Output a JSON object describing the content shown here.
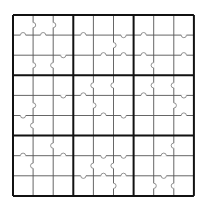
{
  "puzzle": {
    "type": "sudoku-with-border-marks",
    "size": 9,
    "box_size": 3,
    "origin": {
      "x": 13,
      "y": 15
    },
    "cell_size": 20.1,
    "values": [
      [
        "",
        "",
        "",
        "",
        "",
        "",
        "",
        "",
        ""
      ],
      [
        "",
        "",
        "",
        "",
        "",
        "",
        "",
        "",
        ""
      ],
      [
        "",
        "",
        "",
        "",
        "",
        "",
        "",
        "",
        ""
      ],
      [
        "",
        "",
        "",
        "",
        "",
        "",
        "",
        "",
        ""
      ],
      [
        "",
        "",
        "",
        "",
        "",
        "",
        "",
        "",
        ""
      ],
      [
        "",
        "",
        "",
        "",
        "",
        "",
        "",
        "",
        ""
      ],
      [
        "",
        "",
        "",
        "",
        "",
        "",
        "",
        "",
        ""
      ],
      [
        "",
        "",
        "",
        "",
        "",
        "",
        "",
        "",
        ""
      ],
      [
        "",
        "",
        "",
        "",
        "",
        "",
        "",
        "",
        ""
      ]
    ],
    "vertical_marks": [
      {
        "row": 0,
        "after_col": 0,
        "dir": "right"
      },
      {
        "row": 0,
        "after_col": 1,
        "dir": "right"
      },
      {
        "row": 1,
        "after_col": 4,
        "dir": "right"
      },
      {
        "row": 2,
        "after_col": 0,
        "dir": "right"
      },
      {
        "row": 2,
        "after_col": 1,
        "dir": "left"
      },
      {
        "row": 2,
        "after_col": 6,
        "dir": "left"
      },
      {
        "row": 3,
        "after_col": 3,
        "dir": "left"
      },
      {
        "row": 3,
        "after_col": 4,
        "dir": "left"
      },
      {
        "row": 3,
        "after_col": 6,
        "dir": "left"
      },
      {
        "row": 3,
        "after_col": 7,
        "dir": "left"
      },
      {
        "row": 4,
        "after_col": 0,
        "dir": "right"
      },
      {
        "row": 4,
        "after_col": 3,
        "dir": "right"
      },
      {
        "row": 4,
        "after_col": 7,
        "dir": "right"
      },
      {
        "row": 5,
        "after_col": 0,
        "dir": "left"
      },
      {
        "row": 6,
        "after_col": 1,
        "dir": "left"
      },
      {
        "row": 6,
        "after_col": 7,
        "dir": "left"
      },
      {
        "row": 7,
        "after_col": 0,
        "dir": "left"
      },
      {
        "row": 7,
        "after_col": 3,
        "dir": "left"
      },
      {
        "row": 7,
        "after_col": 4,
        "dir": "left"
      },
      {
        "row": 8,
        "after_col": 4,
        "dir": "right"
      },
      {
        "row": 8,
        "after_col": 6,
        "dir": "right"
      },
      {
        "row": 8,
        "after_col": 7,
        "dir": "left"
      }
    ],
    "horizontal_marks": [
      {
        "col": 0,
        "after_row": 0,
        "dir": "up"
      },
      {
        "col": 1,
        "after_row": 0,
        "dir": "up"
      },
      {
        "col": 3,
        "after_row": 0,
        "dir": "up"
      },
      {
        "col": 5,
        "after_row": 0,
        "dir": "down"
      },
      {
        "col": 6,
        "after_row": 0,
        "dir": "up"
      },
      {
        "col": 8,
        "after_row": 0,
        "dir": "down"
      },
      {
        "col": 2,
        "after_row": 1,
        "dir": "down"
      },
      {
        "col": 4,
        "after_row": 1,
        "dir": "up"
      },
      {
        "col": 5,
        "after_row": 1,
        "dir": "up"
      },
      {
        "col": 6,
        "after_row": 1,
        "dir": "up"
      },
      {
        "col": 8,
        "after_row": 1,
        "dir": "up"
      },
      {
        "col": 2,
        "after_row": 3,
        "dir": "down"
      },
      {
        "col": 3,
        "after_row": 3,
        "dir": "up"
      },
      {
        "col": 6,
        "after_row": 3,
        "dir": "up"
      },
      {
        "col": 8,
        "after_row": 3,
        "dir": "down"
      },
      {
        "col": 0,
        "after_row": 4,
        "dir": "down"
      },
      {
        "col": 4,
        "after_row": 4,
        "dir": "up"
      },
      {
        "col": 5,
        "after_row": 4,
        "dir": "down"
      },
      {
        "col": 8,
        "after_row": 4,
        "dir": "up"
      },
      {
        "col": 0,
        "after_row": 6,
        "dir": "up"
      },
      {
        "col": 2,
        "after_row": 6,
        "dir": "up"
      },
      {
        "col": 4,
        "after_row": 6,
        "dir": "down"
      },
      {
        "col": 5,
        "after_row": 6,
        "dir": "down"
      },
      {
        "col": 7,
        "after_row": 6,
        "dir": "up"
      },
      {
        "col": 3,
        "after_row": 7,
        "dir": "down"
      },
      {
        "col": 4,
        "after_row": 7,
        "dir": "up"
      },
      {
        "col": 5,
        "after_row": 7,
        "dir": "up"
      },
      {
        "col": 7,
        "after_row": 7,
        "dir": "down"
      }
    ]
  }
}
